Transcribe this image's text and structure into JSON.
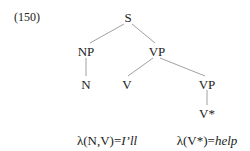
{
  "example_number": "(150)",
  "tree": {
    "root": "S",
    "np": "NP",
    "vp_top": "VP",
    "n": "N",
    "v": "V",
    "vp_low": "VP",
    "v_star": "V*"
  },
  "annotations": {
    "left_prefix": "λ(N,V)=",
    "left_value": "I’ll",
    "right_prefix": "λ(V*)=",
    "right_value": "help"
  }
}
